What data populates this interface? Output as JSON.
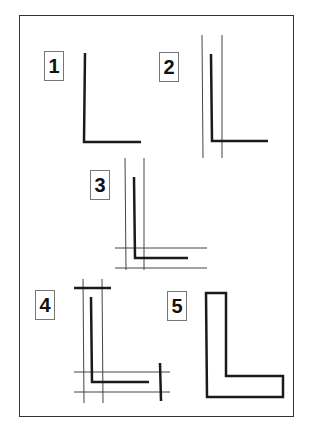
{
  "diagram": {
    "steps": [
      {
        "label": "1",
        "stage": "single L stroke"
      },
      {
        "label": "2",
        "stage": "L stroke with two vertical guide lines"
      },
      {
        "label": "3",
        "stage": "L stroke with vertical and horizontal guide lines"
      },
      {
        "label": "4",
        "stage": "L stroke with guide lines and end cap marks"
      },
      {
        "label": "5",
        "stage": "outlined L shape"
      }
    ]
  }
}
